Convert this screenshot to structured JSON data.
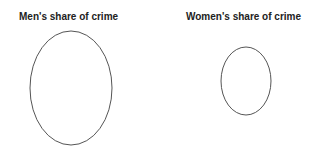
{
  "panels": [
    {
      "title": "Men's share of crime",
      "shape": {
        "cx": 71,
        "cy": 88,
        "rx": 41,
        "ry": 57
      }
    },
    {
      "title": "Women's share of crime",
      "shape": {
        "cx": 246,
        "cy": 81,
        "rx": 25,
        "ry": 34
      }
    }
  ],
  "stroke_color": "#555555"
}
